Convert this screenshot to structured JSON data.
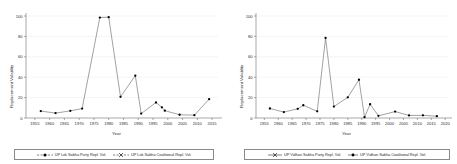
{
  "figure": {
    "panels": [
      {
        "id": "lok-sabha",
        "ylabel": "Replacement Volatility",
        "xlabel": "Year",
        "legend": [
          {
            "label": "UP Lok Sabha Party Repl. Vol.",
            "marker": "filled-circle",
            "dash": "dashed"
          },
          {
            "label": "UP Lok Sabha Coalitional Repl. Vol.",
            "marker": "cross",
            "dash": "dashed"
          }
        ],
        "chart_data": {
          "type": "line",
          "title": "",
          "xlabel": "Year",
          "ylabel": "Replacement Volatility",
          "xlim": [
            1952,
            2017
          ],
          "ylim": [
            0,
            100
          ],
          "yticks": [
            0,
            20,
            40,
            60,
            80,
            100
          ],
          "xticks": [
            1955,
            1960,
            1965,
            1970,
            1975,
            1980,
            1985,
            1990,
            1995,
            2000,
            2005,
            2010,
            2015
          ],
          "grid": true,
          "legend_position": "below",
          "series": [
            {
              "name": "UP Lok Sabha Party Repl. Vol.",
              "marker": "filled-circle",
              "x": [
                1957,
                1962,
                1967,
                1971,
                1977,
                1980,
                1984,
                1989,
                1991,
                1996,
                1998,
                1999,
                2004,
                2009,
                2014
              ],
              "y": [
                6.8,
                4.8,
                7.0,
                9.2,
                98.5,
                98.8,
                20.8,
                41.5,
                4.3,
                15.2,
                10.5,
                7.2,
                3.2,
                2.8,
                18.5
              ]
            },
            {
              "name": "UP Lok Sabha Coalitional Repl. Vol.",
              "marker": "cross",
              "x": [
                1957,
                1962,
                1967,
                1971,
                1977,
                1980,
                1984,
                1989,
                1991,
                1996,
                1998,
                1999,
                2004,
                2009,
                2014
              ],
              "y": [
                6.8,
                4.8,
                7.0,
                9.2,
                98.5,
                98.8,
                20.8,
                41.5,
                4.3,
                15.2,
                10.5,
                7.2,
                3.2,
                2.8,
                18.5
              ]
            }
          ]
        }
      },
      {
        "id": "vidhan-sabha",
        "ylabel": "Replacement Volatility",
        "xlabel": "Year",
        "legend": [
          {
            "label": "UP Vidhan Sabha Party Repl. Vol.",
            "marker": "cross",
            "dash": "solid"
          },
          {
            "label": "UP Vidhan Sabha Coalitional Repl. Vol.",
            "marker": "filled-circle",
            "dash": "solid"
          }
        ],
        "chart_data": {
          "type": "line",
          "title": "",
          "xlabel": "Year",
          "ylabel": "Replacement Volatility",
          "xlim": [
            1952,
            2021
          ],
          "ylim": [
            0,
            100
          ],
          "yticks": [
            0,
            20,
            40,
            60,
            80,
            100
          ],
          "xticks": [
            1955,
            1960,
            1965,
            1970,
            1975,
            1980,
            1985,
            1990,
            1995,
            2000,
            2005,
            2010,
            2015,
            2020
          ],
          "grid": true,
          "legend_position": "below",
          "series": [
            {
              "name": "UP Vidhan Sabha Party Repl. Vol.",
              "marker": "filled-circle",
              "x": [
                1957,
                1962,
                1967,
                1969,
                1974,
                1977,
                1980,
                1985,
                1989,
                1991,
                1993,
                1996,
                2002,
                2007,
                2012,
                2017
              ],
              "y": [
                9.3,
                5.8,
                9.0,
                12.5,
                6.5,
                78.5,
                11.2,
                20.3,
                37.5,
                0.8,
                13.5,
                2.1,
                6.3,
                2.5,
                2.6,
                1.8
              ]
            },
            {
              "name": "UP Vidhan Sabha Coalitional Repl. Vol.",
              "marker": "cross",
              "x": [
                1957,
                1962,
                1967,
                1969,
                1974,
                1977,
                1980,
                1985,
                1989,
                1991,
                1993,
                1996,
                2002,
                2007,
                2012,
                2017
              ],
              "y": [
                9.3,
                5.8,
                9.0,
                12.5,
                6.5,
                78.5,
                11.2,
                20.3,
                37.5,
                0.8,
                13.5,
                2.1,
                6.3,
                2.5,
                2.6,
                1.8
              ]
            }
          ]
        }
      }
    ]
  }
}
